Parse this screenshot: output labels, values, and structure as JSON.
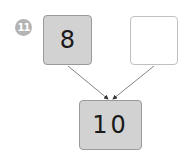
{
  "problem": {
    "number": "11",
    "badge_color": "#b4b4b4"
  },
  "boxes": {
    "top_left": {
      "value": "8",
      "filled": true
    },
    "top_right": {
      "value": "",
      "filled": false
    },
    "bottom": {
      "value": "10",
      "filled": true
    }
  },
  "colors": {
    "box_fill": "#d2d2d2",
    "box_border": "#9a9a9a",
    "arrow": "#555555"
  }
}
